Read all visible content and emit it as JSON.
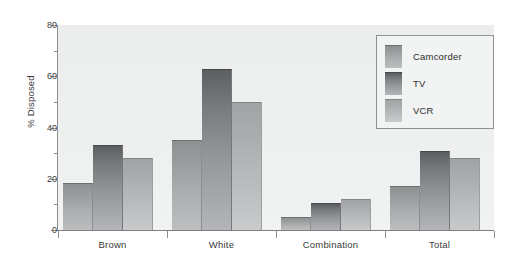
{
  "chart_data": {
    "type": "bar",
    "title": "",
    "subtitle": "",
    "xlabel": "",
    "ylabel": "% Disposed",
    "categories": [
      "Brown",
      "White",
      "Combination",
      "Total"
    ],
    "series": [
      {
        "name": "Camcorder",
        "values": [
          18.5,
          35,
          5,
          17
        ]
      },
      {
        "name": "TV",
        "values": [
          33,
          63,
          10.5,
          31
        ]
      },
      {
        "name": "VCR",
        "values": [
          28,
          50,
          12,
          28
        ]
      }
    ],
    "ylim": [
      0,
      80
    ],
    "ytick_labels": [
      "0",
      "20",
      "40",
      "60",
      "80"
    ],
    "ytick_values": [
      0,
      20,
      40,
      60,
      80
    ],
    "yminor_values": [
      10,
      30,
      50,
      70
    ],
    "grid": false,
    "legend_position": "top-right",
    "legend_entries": [
      "Camcorder",
      "TV",
      "VCR"
    ],
    "annotations": []
  },
  "colors": {
    "plot_background": "#eeefef",
    "axis_line": "#8d8d8d",
    "text": "#3a3a3a",
    "camcorder": "#a6a7a9",
    "tv": "#78797c",
    "vcr": "#b5b6b8",
    "legend_border": "#8f9093",
    "legend_background": "#f2f3f3"
  }
}
